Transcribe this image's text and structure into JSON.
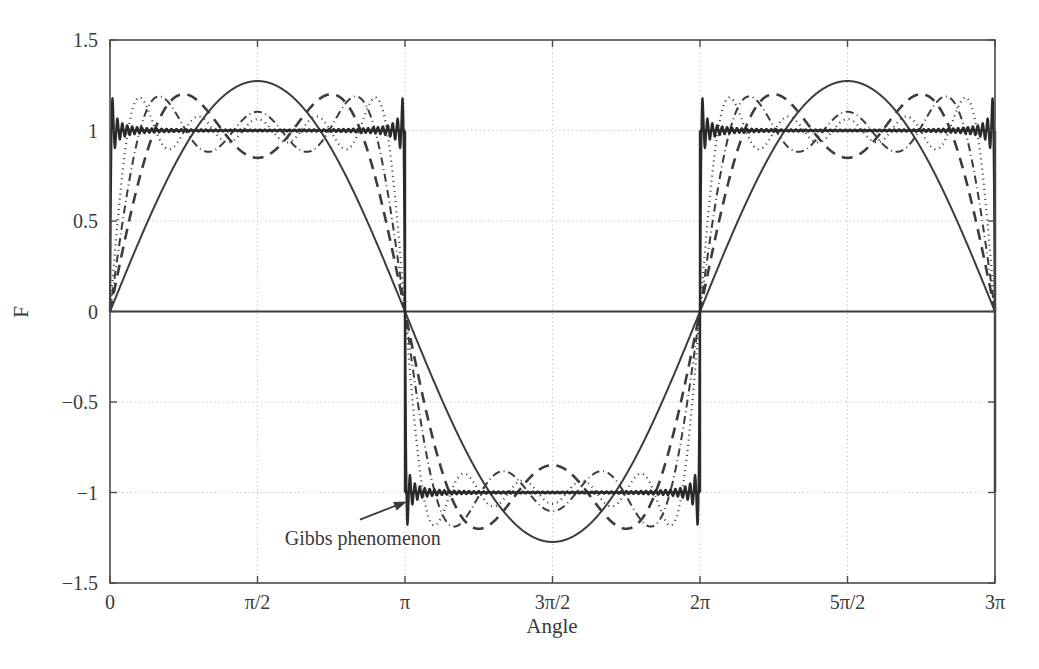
{
  "chart_data": {
    "type": "line",
    "title": "",
    "xlabel": "Angle",
    "ylabel": "F",
    "xlim": [
      0,
      9.42477796
    ],
    "ylim": [
      -1.5,
      1.5
    ],
    "grid": true,
    "grid_style": "dotted",
    "legend": "none",
    "xticks": [
      0,
      1.5707963,
      3.1415927,
      4.712389,
      6.2831853,
      7.8539816,
      9.424778
    ],
    "xtick_labels": [
      "0",
      "π/2",
      "π",
      "3π/2",
      "2π",
      "5π/2",
      "3π"
    ],
    "yticks": [
      -1.5,
      -1,
      -0.5,
      0,
      0.5,
      1,
      1.5
    ],
    "ytick_labels": [
      "−1.5",
      "−1",
      "−0.5",
      "0",
      "0.5",
      "1",
      "1.5"
    ],
    "function_form": "F(x) = (4/π) * sum_{k=1,3,5,...}^{N} sin(k x)/k",
    "series": [
      {
        "name": "N = 1 term",
        "n_terms": 1,
        "style": "solid",
        "width": 2.0,
        "color": "#3c3c3c",
        "peak": 1.273
      },
      {
        "name": "N = 2 terms",
        "n_terms": 2,
        "style": "dashed",
        "width": 2.6,
        "color": "#3c3c3c",
        "peak": 1.196
      },
      {
        "name": "N = 3 terms",
        "n_terms": 3,
        "style": "dashdot",
        "width": 2.0,
        "color": "#3c3c3c",
        "peak": 1.2
      },
      {
        "name": "N = 5 terms",
        "n_terms": 5,
        "style": "dotted",
        "width": 2.2,
        "color": "#3c3c3c",
        "peak": 1.187
      },
      {
        "name": "N = 60 terms (square wave limit)",
        "n_terms": 60,
        "style": "solid",
        "width": 2.2,
        "color": "#2a2a2a",
        "peak": 1.179
      }
    ],
    "square_wave": {
      "amplitude": 1,
      "period": 6.2831853,
      "levels": [
        1,
        -1
      ]
    },
    "gibbs_overshoot_ratio": 1.179,
    "annotations": [
      {
        "text": "Gibbs phenomenon",
        "target_x": 3.1415927,
        "target_y": -1.05,
        "label_x": 1.86,
        "label_y": -1.29,
        "arrow": true
      }
    ]
  },
  "axes": {
    "y_axis_title": "F",
    "x_axis_title": "Angle"
  },
  "annotation": {
    "gibbs_text": "Gibbs phenomenon"
  }
}
